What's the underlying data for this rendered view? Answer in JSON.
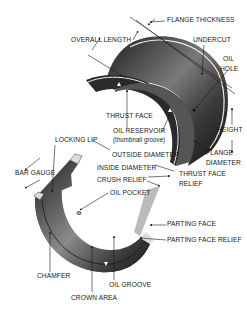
{
  "diagram": {
    "colors": {
      "background": "#ffffff",
      "metal_dark": "#2b2b2b",
      "metal_mid": "#6e6e6e",
      "metal_light": "#c8c8c8",
      "lines": "#1a1a1a"
    },
    "labels": {
      "flange_thickness": "FLANGE THICKNESS",
      "overall_length": "OVERALL LENGTH",
      "undercut": "UNDERCUT",
      "oil_hole_1": "OIL",
      "oil_hole_2": "HOLE",
      "thrust_face": "THRUST FACE",
      "oil_reservoir": "OIL RESERVOIR",
      "thumbnail_groove": "(thumbnail groove)",
      "height": "HEIGHT",
      "locking_lip": "LOCKING LIP",
      "outside_diameter": "OUTSIDE DIAMETER",
      "flange_diameter_1": "FLANGE",
      "flange_diameter_2": "DIAMETER",
      "bar_gauge": "BAR GAUGE",
      "inside_diameter": "INSIDE DIAMETER",
      "thrust_face_relief_1": "THRUST FACE",
      "thrust_face_relief_2": "RELIEF",
      "crush_relief": "CRUSH RELIEF",
      "oil_pocket": "OIL POCKET",
      "parting_face": "PARTING FACE",
      "parting_face_relief": "PARTING FACE RELIEF",
      "chamfer": "CHAMFER",
      "oil_groove": "OIL GROOVE",
      "crown_area": "CROWN AREA"
    }
  }
}
